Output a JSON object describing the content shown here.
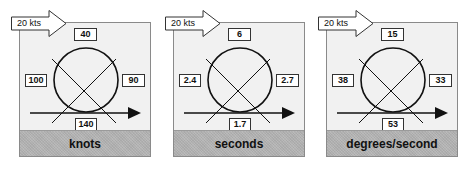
{
  "wind_indicator": {
    "label": "20 kts"
  },
  "panels": [
    {
      "unit": "knots",
      "values": {
        "top": "40",
        "left": "100",
        "right": "90",
        "bottom": "140"
      }
    },
    {
      "unit": "seconds",
      "values": {
        "top": "6",
        "left": "2.4",
        "right": "2.7",
        "bottom": "1.7"
      }
    },
    {
      "unit": "degrees/second",
      "values": {
        "top": "15",
        "left": "38",
        "right": "33",
        "bottom": "53"
      }
    }
  ],
  "colors": {
    "panel_bg": "#f1f1f1",
    "footer_bg": "#b4b4b4",
    "line": "#111111"
  }
}
